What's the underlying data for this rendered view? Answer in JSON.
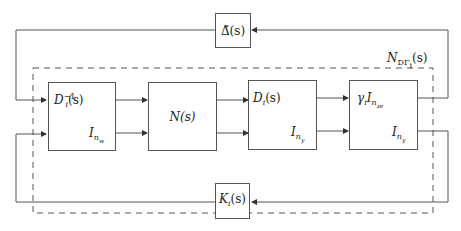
{
  "diagram": {
    "type": "block-diagram",
    "title": "",
    "blocks": {
      "delta": {
        "label": "Δ̃(s)",
        "base": "Δ̃",
        "arg": "(s)"
      },
      "dinv": {
        "label_top": "D_i^{-1}(s)",
        "top_base": "D",
        "top_sub": "i",
        "top_sup": "−1",
        "top_arg": "(s)",
        "label_bottom": "I_{n_w}",
        "bottom_base": "I",
        "bottom_sub": "n",
        "bottom_subsub": "w"
      },
      "n": {
        "label": "N(s)"
      },
      "d": {
        "label_top": "D_i(s)",
        "top_base": "D",
        "top_sub": "i",
        "top_arg": "(s)",
        "label_bottom": "I_{n_y}",
        "bottom_base": "I",
        "bottom_sub": "n",
        "bottom_subsub": "y"
      },
      "gamma": {
        "label_top": "γ_i I_{n_{ze}}",
        "top_gamma": "γ",
        "top_gamma_sub": "i",
        "top_base": "I",
        "top_sub": "n",
        "top_subsub": "ze",
        "label_bottom": "I_{n_y}",
        "bottom_base": "I",
        "bottom_sub": "n",
        "bottom_subsub": "y"
      },
      "k": {
        "label": "K_i(s)",
        "base": "K",
        "sub": "i",
        "arg": "(s)"
      }
    },
    "group": {
      "label": "N_{DΓ_i}(s)",
      "base": "N",
      "sub": "DΓ",
      "subsub": "i",
      "arg": "(s)",
      "style": "dashed"
    },
    "connections": [
      "delta -> dinv (top input)",
      "k -> dinv (bottom input)",
      "dinv -> n (two lines)",
      "n -> d (two lines)",
      "d -> gamma (two lines)",
      "gamma top output -> delta",
      "gamma bottom output -> k"
    ]
  }
}
